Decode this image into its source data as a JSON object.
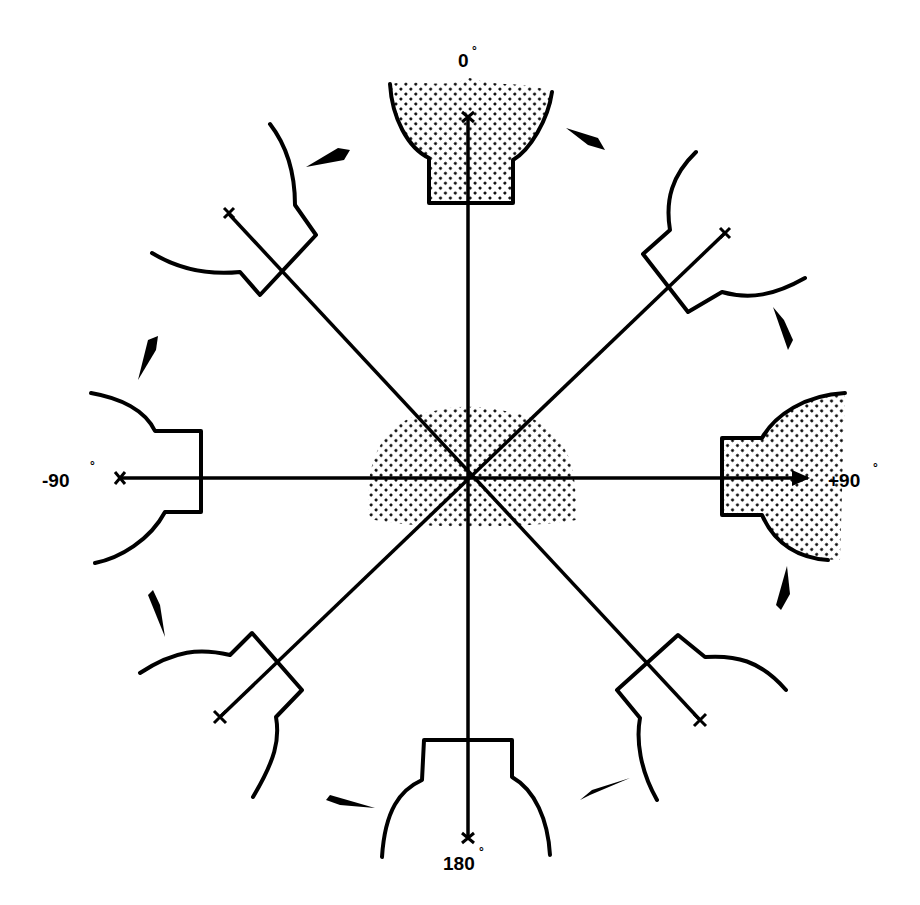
{
  "diagram": {
    "type": "rotation-orientation-diagram",
    "center": {
      "x": 468,
      "y": 478
    },
    "labels": {
      "top": "0",
      "right": "+90",
      "bottom": "180",
      "left": "-90",
      "degree_mark": "°"
    },
    "colors": {
      "ink": "#000000",
      "stipple": "#000000",
      "background": "#ffffff"
    },
    "shaded_positions": [
      "0",
      "+90",
      "center"
    ],
    "arrow_direction": "clockwise"
  }
}
